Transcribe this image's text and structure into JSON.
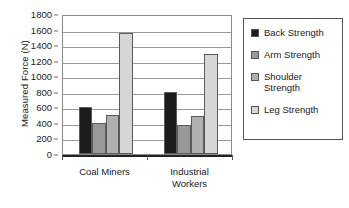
{
  "chart_data": {
    "type": "bar",
    "title": "",
    "xlabel": "",
    "ylabel": "Measured Force (N)",
    "ylim": [
      0,
      1800
    ],
    "yticks": [
      0,
      200,
      400,
      600,
      800,
      1000,
      1200,
      1400,
      1600,
      1800
    ],
    "ytick_labels": [
      "0",
      "200",
      "400",
      "600",
      "800",
      "1000",
      "1200",
      "1400",
      "1600",
      "1800"
    ],
    "grid": true,
    "legend_position": "right",
    "categories": [
      "Coal Miners",
      "Industrial\nWorkers"
    ],
    "series": [
      {
        "name": "Back Strength",
        "values": [
          600,
          800
        ],
        "color": "#1c1c1c"
      },
      {
        "name": "Arm Strength",
        "values": [
          400,
          370
        ],
        "color": "#999999"
      },
      {
        "name": "Shoulder\nStrength",
        "values": [
          500,
          490
        ],
        "color": "#b0b0b0"
      },
      {
        "name": "Leg Strength",
        "values": [
          1560,
          1290
        ],
        "color": "#d6d6d6"
      }
    ]
  },
  "legend": {
    "items": [
      {
        "label": "Back Strength",
        "color": "#1c1c1c"
      },
      {
        "label": "Arm Strength",
        "color": "#999999"
      },
      {
        "label": "Shoulder\nStrength",
        "color": "#b0b0b0"
      },
      {
        "label": "Leg Strength",
        "color": "#d6d6d6"
      }
    ]
  }
}
